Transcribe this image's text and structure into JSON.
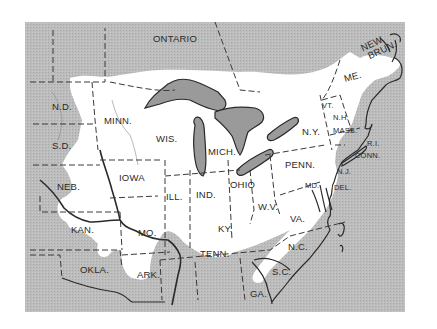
{
  "map": {
    "colors": {
      "background": "#ffffff",
      "shaded_region": "#b9b9b9",
      "range_region": "#ffffff",
      "lakes": "#9a9a9a",
      "lines": "#333333"
    },
    "labels": {
      "ontario": "ONTARIO",
      "new_brun_1": "NEW",
      "new_brun_2": "BRUN.",
      "me": "ME.",
      "vt": "VT.",
      "nh": "N.H.",
      "mass": "MASS.",
      "ri": "R.I.",
      "conn": "CONN.",
      "ny": "N.Y.",
      "nj": "N.J.",
      "del": "DEL.",
      "md": "MD.",
      "penn": "PENN.",
      "ohio": "OHIO",
      "wv": "W.V.",
      "va": "VA.",
      "nc": "N.C.",
      "sc": "S.C.",
      "ga": "GA.",
      "tenn": "TENN.",
      "ky": "KY.",
      "ind": "IND.",
      "ill": "ILL.",
      "mich": "MICH.",
      "wis": "WIS.",
      "minn": "MINN.",
      "iowa": "IOWA",
      "mo": "MO.",
      "ark": "ARK.",
      "okla": "OKLA.",
      "kan": "KAN.",
      "neb": "NEB.",
      "sd": "S.D.",
      "nd": "N.D."
    }
  }
}
